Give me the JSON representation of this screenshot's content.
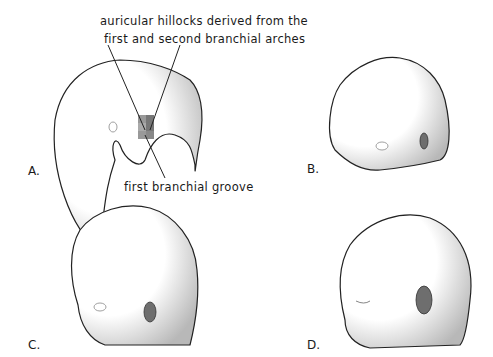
{
  "annotations": {
    "top_line1": "auricular hillocks derived from the",
    "top_line2": "first  and  second branchial arches",
    "bottom": "first branchial groove"
  },
  "panels": [
    {
      "letter": "A."
    },
    {
      "letter": "B."
    },
    {
      "letter": "C."
    },
    {
      "letter": "D."
    }
  ],
  "colors": {
    "outline": "#222222",
    "ear_fill": "#6e6e6e",
    "hillock_fill": "#8a8a8a",
    "shade": "#bbbbbb"
  }
}
